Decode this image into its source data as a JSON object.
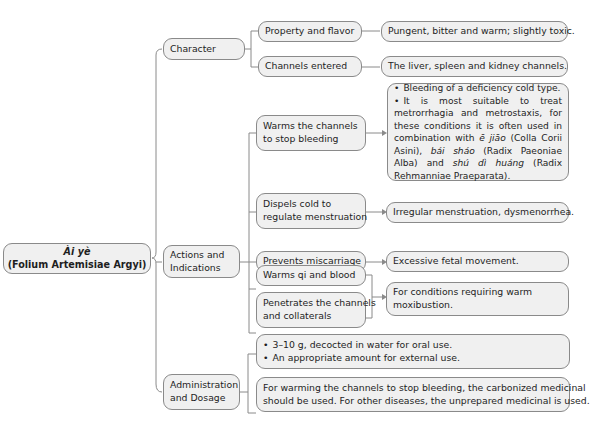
{
  "root": {
    "title": "Ài yè",
    "subtitle": "(Folium Artemisiae Argyi)"
  },
  "branches": [
    {
      "label": "Character",
      "children": [
        {
          "label": "Property and flavor",
          "detail": "Pungent, bitter and warm; slightly toxic."
        },
        {
          "label": "Channels entered",
          "detail": "The liver, spleen and kidney channels."
        }
      ]
    },
    {
      "label_line1": "Actions and",
      "label_line2": "Indications",
      "children": [
        {
          "label_line1": "Warms the channels",
          "label_line2": "to stop bleeding",
          "detail": {
            "bullet1": "Bleeding of a deficiency cold type.",
            "bullet2_a": "It is most suitable to treat metrorrhagia and metrostaxis, for these conditions it is often used in combination with ",
            "herb1": "ē jiāo",
            "bullet2_b": " (Colla Corii Asini), ",
            "herb2": "bái sháo",
            "bullet2_c": " (Radix Paeoniae Alba) and ",
            "herb3": "shú dì huáng",
            "bullet2_d": " (Radix Rehmanniae Praeparata)."
          }
        },
        {
          "label_line1": "Dispels cold to",
          "label_line2": "regulate menstruation",
          "detail": "Irregular menstruation, dysmenorrhea."
        },
        {
          "label": "Prevents miscarriage",
          "detail": "Excessive fetal movement."
        },
        {
          "label": "Warms qi and blood"
        },
        {
          "label_line1": "Penetrates the channels",
          "label_line2": "and collaterals"
        }
      ],
      "shared_detail_line1": "For conditions requiring warm",
      "shared_detail_line2": "moxibustion."
    },
    {
      "label_line1": "Administration",
      "label_line2": "and Dosage",
      "children": [
        {
          "bullet1": "3–10 g, decocted in water for oral use.",
          "bullet2": "An appropriate amount for external use."
        },
        {
          "line1": "For warming the channels to stop bleeding, the carbonized medicinal",
          "line2": "should be used. For other diseases,  the unprepared medicinal is used."
        }
      ]
    }
  ],
  "colors": {
    "node_fill": "#f0f0f0",
    "node_border": "#8a8a8a",
    "connector": "#8a8a8a",
    "text": "#1e1e1e"
  }
}
